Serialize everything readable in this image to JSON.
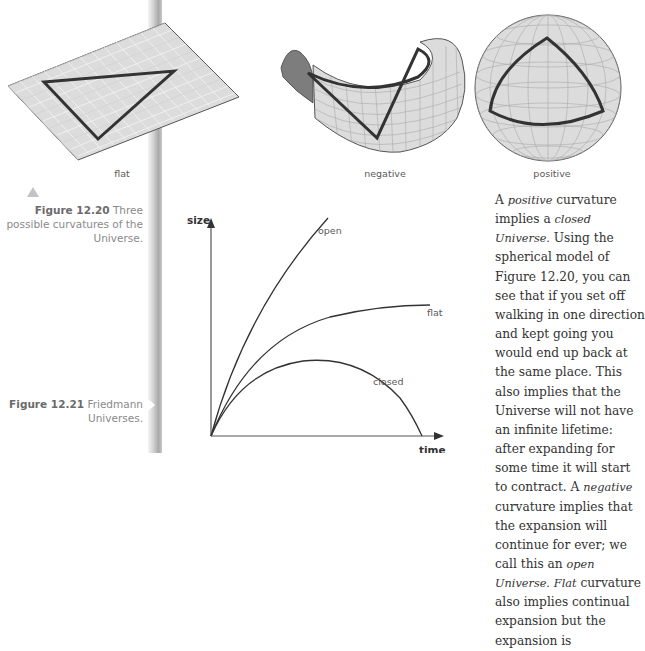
{
  "figure_12_20": {
    "panels": [
      {
        "id": "flat",
        "label": "flat"
      },
      {
        "id": "negative",
        "label": "negative"
      },
      {
        "id": "positive",
        "label": "positive"
      }
    ],
    "caption_number": "Figure 12.20",
    "caption_text": " Three possible curvatures of the Universe.",
    "pointer_icon": "triangle-up-icon"
  },
  "figure_12_21": {
    "caption_number": "Figure 12.21",
    "caption_text": " Friedmann Universes.",
    "pointer_icon": "triangle-right-icon"
  },
  "chart_data": {
    "type": "line",
    "title": "",
    "xlabel": "time",
    "ylabel": "size",
    "grid": false,
    "legend": "inline labels",
    "series": [
      {
        "name": "open",
        "description": "rises steeply and keeps increasing",
        "points": [
          [
            0,
            0
          ],
          [
            0.2,
            0.45
          ],
          [
            0.4,
            0.72
          ],
          [
            0.6,
            0.92
          ],
          [
            0.72,
            1.0
          ]
        ]
      },
      {
        "name": "flat",
        "description": "rises and levels off asymptotically",
        "points": [
          [
            0,
            0
          ],
          [
            0.2,
            0.3
          ],
          [
            0.4,
            0.43
          ],
          [
            0.6,
            0.49
          ],
          [
            0.8,
            0.52
          ],
          [
            1.0,
            0.53
          ]
        ]
      },
      {
        "name": "closed",
        "description": "rises to a maximum then falls back to zero",
        "points": [
          [
            0,
            0
          ],
          [
            0.1,
            0.16
          ],
          [
            0.25,
            0.24
          ],
          [
            0.45,
            0.27
          ],
          [
            0.65,
            0.24
          ],
          [
            0.8,
            0.16
          ],
          [
            0.9,
            0.07
          ],
          [
            0.96,
            0
          ]
        ]
      }
    ],
    "annotations": [
      "open",
      "flat",
      "closed"
    ]
  },
  "body": {
    "segments": [
      {
        "t": "A ",
        "em": false
      },
      {
        "t": "positive",
        "em": true
      },
      {
        "t": " curvature implies a ",
        "em": false
      },
      {
        "t": "closed Universe.",
        "em": true
      },
      {
        "t": " Using the spherical model of Figure 12.20, you can see that if you set off walking in one direction and kept going you would end up back at the same place. This also implies that the Universe will not have an infinite lifetime: after expanding for some time it will start to contract. A ",
        "em": false
      },
      {
        "t": "negative",
        "em": true
      },
      {
        "t": " curvature implies that the expansion will continue for ever; we call this an ",
        "em": false
      },
      {
        "t": "open Universe.",
        "em": true
      },
      {
        "t": " ",
        "em": false
      },
      {
        "t": "Flat",
        "em": true
      },
      {
        "t": " curvature also implies continual expansion but the expansion is",
        "em": false
      }
    ]
  },
  "colors": {
    "surface_fill": "#dcdcdc",
    "grid_line": "#a8a8a8",
    "triangle_stroke": "#333333",
    "caption_gray": "#8a8a8a",
    "body_text": "#333333"
  }
}
